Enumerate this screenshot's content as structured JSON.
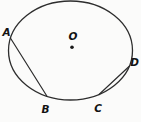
{
  "diagram": {
    "type": "circle-with-center-and-chords",
    "labels": {
      "A": "A",
      "B": "B",
      "C": "C",
      "D": "D",
      "center": "O"
    },
    "points_on_circle": [
      "A",
      "B",
      "C",
      "D"
    ],
    "chords": [
      "AB",
      "CD"
    ],
    "center_marker": "dot"
  },
  "colors": {
    "background": "#fbfbfa",
    "stroke": "#2d2d2d",
    "label_text": "#121212"
  }
}
